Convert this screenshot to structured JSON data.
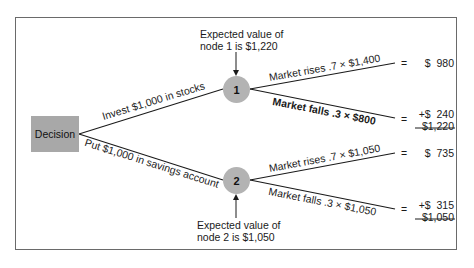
{
  "diagram": {
    "decision_label": "Decision",
    "branches": [
      {
        "label": "Invest $1,000 in stocks",
        "node_label": "1",
        "expected_value_note_line1": "Expected value of",
        "expected_value_note_line2": "node 1 is $1,220",
        "outcomes": [
          {
            "label": "Market rises .7 × $1,400",
            "equals": "=",
            "value": "$  980"
          },
          {
            "label": "Market falls .3 × $800",
            "equals": "=",
            "value": "+$  240"
          }
        ],
        "total": "$1,220"
      },
      {
        "label": "Put $1,000 in savings account",
        "node_label": "2",
        "expected_value_note_line1": "Expected value of",
        "expected_value_note_line2": "node 2 is $1,050",
        "outcomes": [
          {
            "label": "Market rises .7 × $1,050",
            "equals": "=",
            "value": "$  735"
          },
          {
            "label": "Market falls .3 × $1,050",
            "equals": "=",
            "value": "+$  315"
          }
        ],
        "total": "$1,050"
      }
    ],
    "colors": {
      "node_fill": "#b3b3b3",
      "decision_fill": "#a8a8a8",
      "line": "#1a1a1a",
      "frame": "#6a6a6a"
    }
  }
}
